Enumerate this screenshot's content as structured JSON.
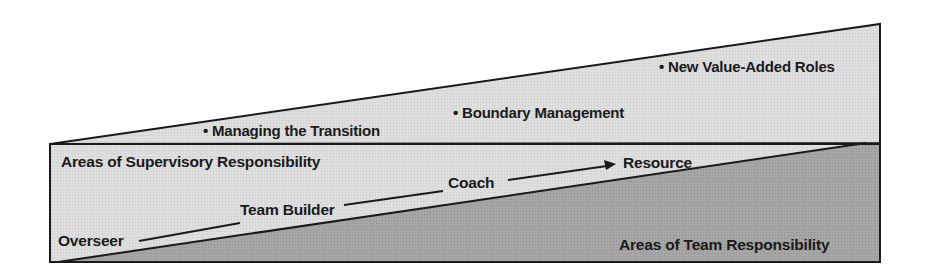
{
  "diagram": {
    "colors": {
      "light_fill": "#dcdcdc",
      "dark_fill": "#a4a4a4",
      "stroke": "#1a1a1a",
      "background": "#ffffff"
    },
    "upper_region": {
      "bullets": [
        {
          "label": "Managing the Transition"
        },
        {
          "label": "Boundary Management"
        },
        {
          "label": "New Value-Added Roles"
        }
      ]
    },
    "middle_region": {
      "label": "Areas of Supervisory Responsibility"
    },
    "lower_region": {
      "label": "Areas of Team Responsibility"
    },
    "progression": {
      "steps": [
        {
          "label": "Overseer"
        },
        {
          "label": "Team Builder"
        },
        {
          "label": "Coach"
        },
        {
          "label": "Resource"
        }
      ]
    },
    "bullet_glyph": "•"
  }
}
